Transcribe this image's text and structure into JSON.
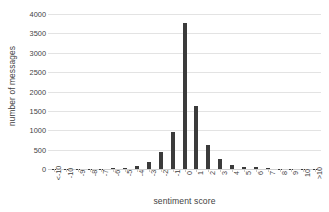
{
  "chart_data": {
    "type": "bar",
    "title": "",
    "xlabel": "sentiment score",
    "ylabel": "number of messages",
    "categories": [
      "<-10",
      "-10",
      "-9",
      "-8",
      "-7",
      "-6",
      "-5",
      "-4",
      "-3",
      "-2",
      "-1",
      "0",
      "1",
      "2",
      "3",
      "4",
      "5",
      "6",
      "7",
      "8",
      "9",
      "10",
      ">10"
    ],
    "values": [
      8,
      4,
      3,
      6,
      10,
      18,
      30,
      90,
      170,
      450,
      950,
      3780,
      1615,
      620,
      270,
      110,
      60,
      40,
      15,
      12,
      6,
      4,
      8
    ],
    "ylim": [
      0,
      4000
    ],
    "ytick_values": [
      0,
      500,
      1000,
      1500,
      2000,
      2500,
      3000,
      3500,
      4000
    ],
    "ytick_labels": [
      "0",
      "500",
      "1000",
      "1500",
      "2000",
      "2500",
      "3000",
      "3500",
      "4000"
    ],
    "grid": "horizontal",
    "legend": "none",
    "bar_color": "#3b3b3b",
    "gridline_color": "#e3e3e3",
    "text_color": "#3f3f3f",
    "background_color": "#ffffff",
    "xtick_rotation": -90
  }
}
